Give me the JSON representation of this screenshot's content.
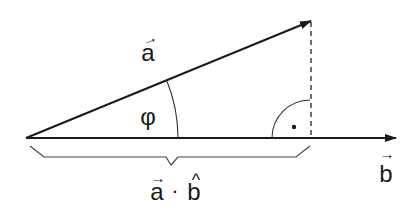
{
  "diagram": {
    "colors": {
      "ink": "#1a1a1a",
      "thin": "#333333",
      "brace": "#444444",
      "background": "#ffffff"
    },
    "labels": {
      "vector_a": "a",
      "vector_a_arrow": "→",
      "vector_b": "b",
      "vector_b_arrow": "→",
      "angle": "φ",
      "projection_a": "a",
      "projection_a_arrow": "→",
      "projection_dot": "·",
      "projection_b": "b",
      "projection_b_hat": "^",
      "right_angle_dot": "•"
    },
    "elements": [
      {
        "id": "vector-a",
        "type": "arrow",
        "from": [
          26,
          138
        ],
        "to": [
          311,
          21
        ]
      },
      {
        "id": "vector-b",
        "type": "arrow",
        "from": [
          26,
          138
        ],
        "to": [
          396,
          138
        ]
      },
      {
        "id": "perpendicular",
        "type": "dashed-line",
        "from": [
          311,
          21
        ],
        "to": [
          311,
          138
        ]
      },
      {
        "id": "angle-arc",
        "type": "arc",
        "center": [
          26,
          138
        ],
        "label": "φ"
      },
      {
        "id": "right-angle-marker",
        "type": "arc-with-dot",
        "center": [
          311,
          138
        ]
      },
      {
        "id": "projection-brace",
        "type": "brace",
        "from": [
          26,
          138
        ],
        "to": [
          311,
          138
        ],
        "label": "a · b̂"
      }
    ]
  }
}
